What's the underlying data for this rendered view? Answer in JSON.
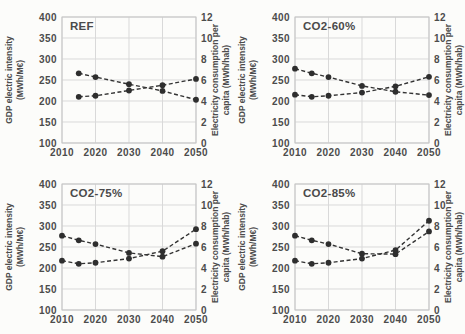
{
  "style": {
    "grid_color": "#d9d9d9",
    "border_color": "#c5c5c5",
    "series_color": "#333333",
    "marker_color": "#2e2e2e",
    "text_color": "#4c4c4c",
    "background": "#fcfcfa"
  },
  "axes": {
    "left_title": [
      "GDP electric intensity",
      "(MWh/M€)"
    ],
    "right_title": [
      "Electricity consumption per",
      "capita (MWh/hab)"
    ],
    "left_range": [
      100,
      400
    ],
    "right_range": [
      0,
      12
    ],
    "x_range": [
      2010,
      2050
    ],
    "left_ticks": [
      400,
      350,
      300,
      250,
      200,
      150,
      100
    ],
    "right_ticks": [
      12,
      10,
      8,
      6,
      4,
      2,
      0
    ],
    "x_ticks": [
      2010,
      2020,
      2030,
      2040,
      2050
    ]
  },
  "chart_data": [
    {
      "type": "line",
      "title": "REF",
      "x": [
        2015,
        2020,
        2030,
        2040,
        2050
      ],
      "series": [
        {
          "name": "GDP electric intensity (MWh/M€)",
          "axis": "left",
          "linestyle": "dashed",
          "marker": "circle",
          "values": [
            266,
            257,
            240,
            224,
            203
          ]
        },
        {
          "name": "Electricity consumption per capita (MWh/hab)",
          "axis": "right",
          "linestyle": "dashed",
          "marker": "circle",
          "values": [
            4.4,
            4.5,
            5.0,
            5.5,
            6.1
          ]
        }
      ]
    },
    {
      "type": "line",
      "title": "CO2-60%",
      "x": [
        2010,
        2015,
        2020,
        2030,
        2040,
        2050
      ],
      "series": [
        {
          "name": "GDP electric intensity (MWh/M€)",
          "axis": "left",
          "linestyle": "dashed",
          "marker": "circle",
          "values": [
            277,
            266,
            257,
            236,
            222,
            214
          ]
        },
        {
          "name": "Electricity consumption per capita (MWh/hab)",
          "axis": "right",
          "linestyle": "dashed",
          "marker": "circle",
          "values": [
            4.6,
            4.4,
            4.5,
            4.8,
            5.4,
            6.3
          ]
        }
      ]
    },
    {
      "type": "line",
      "title": "CO2-75%",
      "x": [
        2010,
        2015,
        2020,
        2030,
        2040,
        2050
      ],
      "series": [
        {
          "name": "GDP electric intensity (MWh/M€)",
          "axis": "left",
          "linestyle": "dashed",
          "marker": "circle",
          "values": [
            277,
            266,
            257,
            236,
            227,
            258
          ]
        },
        {
          "name": "Electricity consumption per capita (MWh/hab)",
          "axis": "right",
          "linestyle": "dashed",
          "marker": "circle",
          "values": [
            4.7,
            4.4,
            4.5,
            4.9,
            5.6,
            7.7
          ]
        }
      ]
    },
    {
      "type": "line",
      "title": "CO2-85%",
      "x": [
        2010,
        2015,
        2020,
        2030,
        2040,
        2050
      ],
      "series": [
        {
          "name": "GDP electric intensity (MWh/M€)",
          "axis": "left",
          "linestyle": "dashed",
          "marker": "circle",
          "values": [
            277,
            266,
            257,
            234,
            233,
            287
          ]
        },
        {
          "name": "Electricity consumption per capita (MWh/hab)",
          "axis": "right",
          "linestyle": "dashed",
          "marker": "circle",
          "values": [
            4.7,
            4.4,
            4.5,
            4.9,
            5.7,
            8.5
          ]
        }
      ]
    }
  ]
}
